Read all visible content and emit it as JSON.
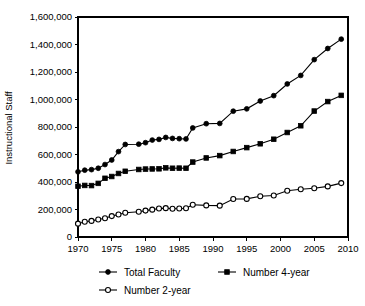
{
  "chart_data": {
    "type": "line",
    "title": "",
    "xlabel": "",
    "ylabel": "Instructional Staff",
    "xlim": [
      1970,
      2010
    ],
    "ylim": [
      0,
      1600000
    ],
    "grid": false,
    "legend_position": "bottom",
    "x_ticks": [
      1970,
      1975,
      1980,
      1985,
      1990,
      1995,
      2000,
      2005,
      2010
    ],
    "x_tick_labels": [
      "1970",
      "1975",
      "1980",
      "1985",
      "1990",
      "1995",
      "2000",
      "2005",
      "2010"
    ],
    "y_ticks": [
      0,
      200000,
      400000,
      600000,
      800000,
      1000000,
      1200000,
      1400000,
      1600000
    ],
    "y_tick_labels": [
      "0",
      "200,000",
      "400,000",
      "600,000",
      "800,000",
      "1,000,000",
      "1,200,000",
      "1,400,000",
      "1,600,000"
    ],
    "series": [
      {
        "name": "Total Faculty",
        "marker": "filled-circle",
        "x": [
          1970,
          1971,
          1972,
          1973,
          1974,
          1975,
          1976,
          1977,
          1979,
          1980,
          1981,
          1982,
          1983,
          1984,
          1985,
          1986,
          1987,
          1989,
          1991,
          1993,
          1995,
          1997,
          1999,
          2001,
          2003,
          2005,
          2007,
          2009
        ],
        "values": [
          474000,
          486000,
          490000,
          500000,
          527000,
          560000,
          621000,
          673000,
          675000,
          686000,
          705000,
          710000,
          724000,
          717000,
          715000,
          713000,
          793000,
          824000,
          826000,
          915000,
          932000,
          989000,
          1028000,
          1113000,
          1175000,
          1290000,
          1371000,
          1439000
        ]
      },
      {
        "name": "Number 4-year",
        "marker": "filled-square",
        "x": [
          1970,
          1971,
          1972,
          1973,
          1974,
          1975,
          1976,
          1977,
          1979,
          1980,
          1981,
          1982,
          1983,
          1984,
          1985,
          1986,
          1987,
          1989,
          1991,
          1993,
          1995,
          1997,
          1999,
          2001,
          2003,
          2005,
          2007,
          2009
        ],
        "values": [
          369000,
          375000,
          374000,
          390000,
          427000,
          440000,
          462000,
          478000,
          491000,
          494000,
          495000,
          496000,
          503000,
          500000,
          501000,
          500000,
          545000,
          575000,
          592000,
          622000,
          650000,
          678000,
          711000,
          760000,
          809000,
          916000,
          985000,
          1030000
        ]
      },
      {
        "name": "Number 2-year",
        "marker": "open-circle",
        "x": [
          1970,
          1971,
          1972,
          1973,
          1974,
          1975,
          1976,
          1977,
          1979,
          1980,
          1981,
          1982,
          1983,
          1984,
          1985,
          1986,
          1987,
          1989,
          1991,
          1993,
          1995,
          1997,
          1999,
          2001,
          2003,
          2005,
          2007,
          2009
        ],
        "values": [
          97000,
          111000,
          117000,
          127000,
          136000,
          152000,
          164000,
          176000,
          184000,
          192000,
          199000,
          207000,
          210000,
          206000,
          207000,
          209000,
          235000,
          230000,
          228000,
          276000,
          277000,
          296000,
          302000,
          336000,
          347000,
          355000,
          368000,
          392000
        ]
      }
    ],
    "legend": [
      {
        "label": "Total Faculty",
        "marker": "filled-circle"
      },
      {
        "label": "Number 4-year",
        "marker": "filled-square"
      },
      {
        "label": "Number 2-year",
        "marker": "open-circle"
      }
    ],
    "colors": {
      "series": "#000000",
      "axis": "#000000",
      "background": "#ffffff"
    }
  }
}
